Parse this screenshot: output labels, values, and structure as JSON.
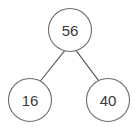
{
  "figure": {
    "type": "binary-tree-diagram",
    "background_color": "#ffffff",
    "node_fill_color": "#ffffff",
    "node_stroke_color": "#6b6b6b",
    "edge_color": "#555555",
    "label_color": "#3a3a3a"
  },
  "tree": {
    "root": {
      "label": "56",
      "cx": 70,
      "cy": 30,
      "r": 21.5
    },
    "children": [
      {
        "label": "16",
        "cx": 30,
        "cy": 100,
        "r": 21.5
      },
      {
        "label": "40",
        "cx": 108,
        "cy": 100,
        "r": 21.5
      }
    ],
    "edges": [
      {
        "from": "56",
        "to": "16",
        "x1": 64.5,
        "y1": 50.8,
        "x2": 40.8,
        "y2": 80.5
      },
      {
        "from": "56",
        "to": "40",
        "x1": 76.2,
        "y1": 50.6,
        "x2": 98.4,
        "y2": 80.3
      }
    ]
  }
}
